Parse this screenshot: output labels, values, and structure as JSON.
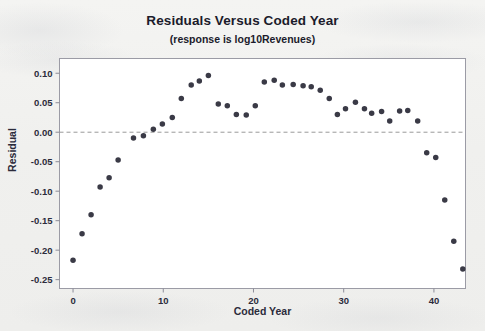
{
  "chart_data": {
    "type": "scatter",
    "title": "Residuals Versus Coded Year",
    "subtitle": "(response is log10Revenues)",
    "xlabel": "Coded Year",
    "ylabel": "Residual",
    "xlim": [
      -1.5,
      43.5
    ],
    "ylim": [
      -0.265,
      0.125
    ],
    "xticks": [
      0,
      10,
      20,
      30,
      40
    ],
    "xtick_labels": [
      "0",
      "10",
      "20",
      "30",
      "40"
    ],
    "yticks": [
      0.1,
      0.05,
      0.0,
      -0.05,
      -0.1,
      -0.15,
      -0.2,
      -0.25
    ],
    "ytick_labels": [
      "0.10",
      "0.05",
      "0.00",
      "-0.05",
      "-0.10",
      "-0.15",
      "-0.20",
      "-0.25"
    ],
    "grid": false,
    "reference_line": {
      "orientation": "horizontal",
      "value": 0.0,
      "style": "dashed",
      "color": "#9a9a9a"
    },
    "legend": null,
    "marker": {
      "shape": "circle",
      "color": "#3a3a46",
      "size": 4.4
    },
    "x": [
      0,
      1,
      2,
      3,
      4,
      5,
      6.7,
      7.8,
      8.9,
      9.9,
      11,
      12,
      13.1,
      14,
      15,
      16.1,
      17.1,
      18.1,
      19.2,
      20.2,
      21.2,
      22.3,
      23.2,
      24.4,
      25.5,
      26.4,
      27.4,
      28.4,
      29.3,
      30.2,
      31.3,
      32.3,
      33.1,
      34.2,
      35.1,
      36.2,
      37.1,
      38.2,
      39.2,
      40.2,
      41.2
    ],
    "y": [
      -0.217,
      -0.172,
      -0.14,
      -0.093,
      -0.077,
      -0.047,
      -0.01,
      -0.006,
      0.005,
      0.014,
      0.025,
      0.057,
      0.08,
      0.087,
      0.096,
      0.048,
      0.045,
      0.03,
      0.029,
      0.045,
      0.085,
      0.088,
      0.08,
      0.081,
      0.079,
      0.077,
      0.071,
      0.057,
      0.03,
      0.04,
      0.051,
      0.04,
      0.032,
      0.035,
      0.019,
      0.036,
      0.037,
      0.019,
      -0.035,
      -0.043,
      -0.115
    ],
    "extra_points": {
      "note": "final descending tail",
      "x": [
        42.2,
        43.2
      ],
      "y": [
        -0.185,
        -0.232
      ]
    }
  }
}
